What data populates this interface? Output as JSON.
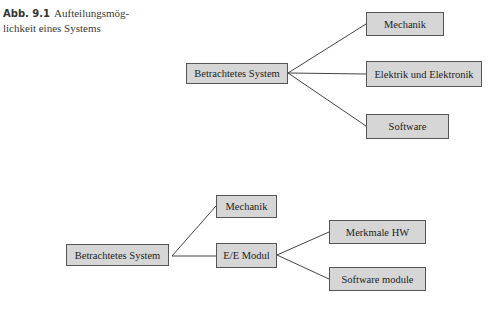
{
  "caption": {
    "label": "Abb. 9.1",
    "text": "Aufteilungsmöglichkeit eines Systems",
    "line1": "Aufteilungsmög-",
    "line2": "lichkeit eines Systems"
  },
  "diagram_top": {
    "root": "Betrachtetes System",
    "children": [
      "Mechanik",
      "Elektrik und Elektronik",
      "Software"
    ]
  },
  "diagram_bottom": {
    "root": "Betrachtetes System",
    "children": [
      "Mechanik",
      "E/E Modul"
    ],
    "ee_children": [
      "Merkmale HW",
      "Software module"
    ]
  },
  "colors": {
    "box_fill": "#d6d6d6",
    "box_border": "#555555",
    "line": "#444444"
  }
}
